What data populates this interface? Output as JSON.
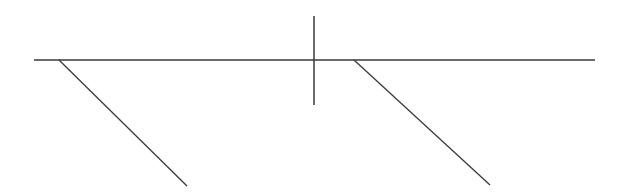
{
  "canvas": {
    "width": 620,
    "height": 195,
    "background_color": "#ffffff"
  },
  "drawing": {
    "title": "Line drawing: horizontal axis with vertical tick and two descending diagonal rays",
    "stroke_color": "#3a3a3a",
    "stroke_width": 1.4,
    "shapes": [
      {
        "name": "horizontal-baseline",
        "type": "line",
        "x1": 34,
        "y1": 60,
        "x2": 595,
        "y2": 60,
        "stroke_color": "#3a3a3a",
        "stroke_width": 1.6
      },
      {
        "name": "vertical-tick",
        "type": "line",
        "x1": 314,
        "y1": 16,
        "x2": 314,
        "y2": 105,
        "stroke_color": "#3a3a3a",
        "stroke_width": 1.5
      },
      {
        "name": "left-diagonal-ray",
        "type": "line",
        "x1": 59,
        "y1": 60,
        "x2": 187,
        "y2": 186,
        "stroke_color": "#3a3a3a",
        "stroke_width": 1.3
      },
      {
        "name": "right-diagonal-ray",
        "type": "line",
        "x1": 354,
        "y1": 60,
        "x2": 490,
        "y2": 185,
        "stroke_color": "#3a3a3a",
        "stroke_width": 1.3
      }
    ]
  }
}
